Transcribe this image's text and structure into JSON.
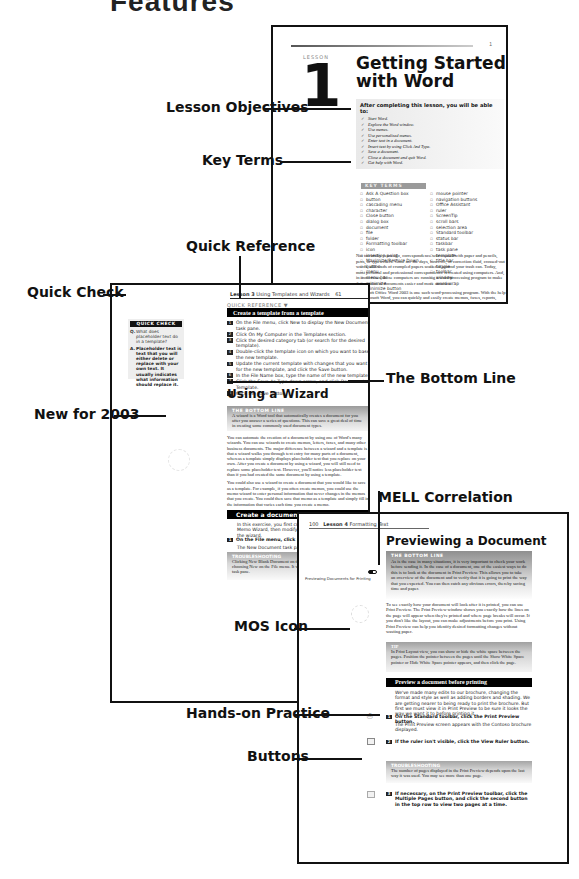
{
  "header": {
    "title_fragment": "Features"
  },
  "callouts": {
    "lesson_objectives": "Lesson Objectives",
    "key_terms": "Key Terms",
    "quick_reference": "Quick Reference",
    "quick_check": "Quick Check",
    "new_for_2003": "New for 2003",
    "the_bottom_line": "The Bottom Line",
    "mell_correlation": "MELL Correlation",
    "mos_icon": "MOS Icon",
    "hands_on_practice": "Hands-on Practice",
    "buttons": "Buttons"
  },
  "page1": {
    "page_number": "1",
    "lesson_label": "LESSON",
    "lesson_number": "1",
    "title_line1": "Getting Started",
    "title_line2": "with Word",
    "objectives_heading": "After completing this lesson, you will be able to:",
    "objectives": [
      "Start Word.",
      "Explore the Word window.",
      "Use menus.",
      "Use personalized menus.",
      "Enter text in a document.",
      "Insert text by using Click And Type.",
      "Save a document.",
      "Close a document and quit Word.",
      "Get help with Word."
    ],
    "key_terms_heading": "KEY TERMS",
    "key_terms_col1": [
      "Ask A Question box",
      "button",
      "cascading menu",
      "character",
      "Close button",
      "dialog box",
      "document",
      "file",
      "folder",
      "Formatting toolbar",
      "icon",
      "insertion point",
      "Maximize/Restore Down",
      "button",
      "menu",
      "menu bar",
      "minimize",
      "Minimize button"
    ],
    "key_terms_col2": [
      "mouse pointer",
      "navigation buttons",
      "Office Assistant",
      "ruler",
      "ScreenTip",
      "scroll bars",
      "selection area",
      "Standard toolbar",
      "status bar",
      "taskbar",
      "task pane",
      "template",
      "title bar",
      "toggle",
      "toolbar",
      "window",
      "word wrap"
    ],
    "body_p1": "Not too many years ago, correspondence was created with paper and pencils, pens, or typewriters. Gone are the days, however, of correction fluid, crossed-out words, and wads of crumpled papers scattered around your trash can. Today, most personal and professional correspondence is created using computers. And, in most cases, those computers are running a word-processing program to make the creation of documents easier and more accurate.",
    "body_p2": "Microsoft Office Word 2003 is one such word-processing program. With the help of Microsoft Word, you can quickly and easily create memos, faxes, reports, letters, charts, and newsletters. You can also, among other"
  },
  "page2": {
    "running_head_lesson": "Lesson 3",
    "running_head_title": "Using Templates and Wizards",
    "page_number": "61",
    "quick_reference_label": "QUICK REFERENCE ▼",
    "quick_reference_title": "Create a template from a template",
    "quick_reference_steps": [
      "On the File menu, click New to display the New Document task pane.",
      "Click On My Computer in the Templates section.",
      "Click the desired category tab (or search for the desired template).",
      "Double-click the template icon on which you want to base the new template.",
      "Update the current template with changes that you want for the new template, and click the Save button.",
      "In the File Name box, type the name of the new template.",
      "Click the Save As Type down arrow, and click Document Template.",
      "Click the Save button."
    ],
    "quick_check_heading": "QUICK CHECK",
    "quick_check_q_marker": "Q.",
    "quick_check_question": "What does placeholder text do in a template?",
    "quick_check_a_marker": "A.",
    "quick_check_answer": "Placeholder text is text that you will either delete or replace with your own text. It usually indicates what information should replace it.",
    "section_heading": "Using a Wizard",
    "bottom_line_heading": "THE BOTTOM LINE",
    "bottom_line_text": "A wizard is a Word tool that automatically creates a document for you after you answer a series of questions. This can save a great deal of time in creating some commonly used document types.",
    "body_p1": "You can automate the creation of a document by using one of Word's many wizards. You can use wizards to create memos, letters, faxes, and many other business documents. The major difference between a wizard and a template is that a wizard walks you through text entry for many parts of a document, whereas a template simply displays placeholder text that you replace on your own. After you create a document by using a wizard, you will still need to replace some placeholder text. However, you'll notice less placeholder text than if you had created the same document by using a template.",
    "body_p2": "You could also use a wizard to create a document that you would like to save as a template. For example, if you often create memos, you could use the memo wizard to enter personal information that never changes in the memos that you create. You could then save that memo as a template and simply fill in the information that varies each time you create a memo.",
    "practice_title": "Create a document using a Wizard",
    "practice_intro": "In this exercise, you first create a document using the Memo Wizard, then modify and save the memo created by the wizard.",
    "step1_num": "1",
    "step1": "On the File menu, click New.",
    "step1_result": "The New Document task pane appears.",
    "tip_heading": "TROUBLESHOOTING",
    "tip_text": "Clicking New Blank Document on the Standard toolbar is not the same as choosing New on the File menu. It will not display the New Document task pane."
  },
  "page3": {
    "page_number": "100",
    "running_head_lesson": "Lesson 4",
    "running_head_title": "Formatting Text",
    "section_heading": "Previewing a Document",
    "mell_label": "Previewing Documents for Printing",
    "bottom_line_heading": "THE BOTTOM LINE",
    "bottom_line_text": "As is the case in many situations, it is very important to check your work before sending it. In the case of a document, one of the easiest ways to do this is to look at the document in Print Preview. This allows you to take an overview of the document and to verify that it is going to print the way that you expected. You can then catch any obvious errors, thereby saving time and paper.",
    "body_p1": "To see exactly how your document will look after it is printed, you can use Print Preview. The Print Preview window shows you exactly how the lines on the page will appear when they're printed and where page breaks will occur. If you don't like the layout, you can make adjustments before you print. Using Print Preview can help you identify desired formatting changes without wasting paper.",
    "tip_heading": "TIP",
    "tip_text": "In Print Layout view, you can show or hide the white space between the pages. Position the pointer between the pages until the Show White Space pointer or Hide White Space pointer appears, and then click the page.",
    "practice_title": "Preview a document before printing",
    "practice_intro": "We've made many edits to our brochure, changing the format and style as well as adding borders and shading. We are getting nearer to being ready to print the brochure. But first we must view it in Print Preview to be sure it looks the way we want it to before printing it.",
    "steps": [
      {
        "num": "1",
        "text": "On the Standard toolbar, click the Print Preview button.",
        "result": "The Print Preview screen appears with the Contoso brochure displayed."
      },
      {
        "num": "2",
        "text": "If the ruler isn't visible, click the View Ruler button.",
        "result": ""
      },
      {
        "num": "3",
        "text": "If necessary, on the Print Preview toolbar, click the Multiple Pages button, and click the second button in the top row to view two pages at a time.",
        "result": ""
      }
    ],
    "trouble_heading": "TROUBLESHOOTING",
    "trouble_text": "The number of pages displayed in the Print Preview depends upon the last way it was used. You may see more than one page.",
    "button_icons": [
      "print-preview-button-icon",
      "view-ruler-button-icon",
      "multiple-pages-button-icon"
    ]
  }
}
